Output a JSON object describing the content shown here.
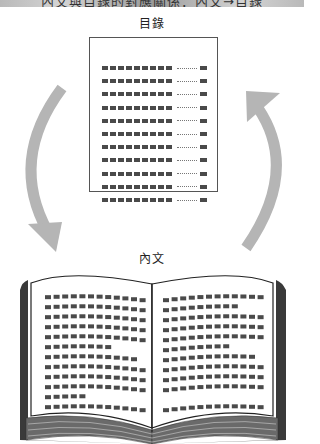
{
  "banner": {
    "title_partial": "內文與目錄的對應關係：內文→目錄",
    "colors": {
      "light": "#d4d4d4",
      "dark": "#9a9a9a"
    }
  },
  "toc": {
    "label": "目錄",
    "row_count": 11,
    "dashes_per_row": 9,
    "rows": [
      {
        "entry": "■■■■■■■■■",
        "leader": "……",
        "page": "■"
      },
      {
        "entry": "■■■■■■■■■",
        "leader": "……",
        "page": "■"
      },
      {
        "entry": "■■■■■■■■■",
        "leader": "……",
        "page": "■"
      },
      {
        "entry": "■■■■■■■■■",
        "leader": "……",
        "page": "■"
      },
      {
        "entry": "■■■■■■■■■",
        "leader": "……",
        "page": "■"
      },
      {
        "entry": "■■■■■■■■■",
        "leader": "……",
        "page": "■"
      },
      {
        "entry": "■■■■■■■■■",
        "leader": "……",
        "page": "■"
      },
      {
        "entry": "■■■■■■■■■",
        "leader": "……",
        "page": "■"
      },
      {
        "entry": "■■■■■■■■■",
        "leader": "……",
        "page": "■"
      },
      {
        "entry": "■■■■■■■■■",
        "leader": "……",
        "page": "■"
      },
      {
        "entry": "■■■■■■■■■",
        "leader": "……",
        "page": "■"
      }
    ]
  },
  "body": {
    "label": "內文",
    "left_page_lines": [
      12,
      12,
      12,
      12,
      12,
      8,
      11,
      12,
      12,
      12,
      5,
      12
    ],
    "right_page_lines": [
      12,
      9,
      12,
      12,
      12,
      8,
      11,
      12,
      12,
      12,
      0,
      12
    ]
  },
  "arrows": {
    "left": {
      "direction": "toc-to-body",
      "icon": "curved-arrow-down-icon"
    },
    "right": {
      "direction": "body-to-toc",
      "icon": "curved-arrow-up-icon"
    },
    "color": "#b5b5b5"
  },
  "colors": {
    "dash": "#4a4a4a",
    "border": "#555555",
    "cover": "#3a3a3a",
    "arrow": "#b5b5b5"
  }
}
